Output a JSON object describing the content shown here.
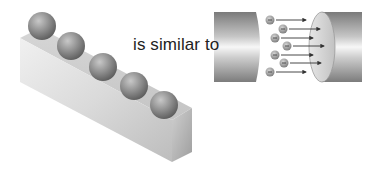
{
  "caption": "is similar to",
  "left_figure": {
    "name": "bar-with-balls",
    "ball_count": 5,
    "balls": [
      {
        "cx": 42,
        "cy": 28
      },
      {
        "cx": 70,
        "cy": 46
      },
      {
        "cx": 104,
        "cy": 68
      },
      {
        "cx": 134,
        "cy": 87
      },
      {
        "cx": 163,
        "cy": 104
      }
    ]
  },
  "right_figure": {
    "name": "wire-gap-electrons",
    "electron_symbol": "−",
    "electrons": [
      {
        "cx": 270,
        "cy": 20,
        "arrow_end": 306
      },
      {
        "cx": 283,
        "cy": 29,
        "arrow_end": 320
      },
      {
        "cx": 275,
        "cy": 38,
        "arrow_end": 313
      },
      {
        "cx": 287,
        "cy": 46,
        "arrow_end": 324
      },
      {
        "cx": 275,
        "cy": 55,
        "arrow_end": 313
      },
      {
        "cx": 284,
        "cy": 63,
        "arrow_end": 321
      },
      {
        "cx": 270,
        "cy": 72,
        "arrow_end": 306
      }
    ]
  },
  "colors": {
    "background": "#ffffff",
    "text": "#222222",
    "metal_dark": "#8a8a8a",
    "metal_light": "#f2f2f2",
    "ball": "#8c8c8c",
    "arrow": "#333333"
  }
}
